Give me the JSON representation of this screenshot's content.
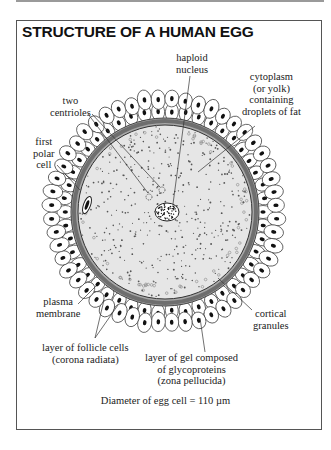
{
  "figure": {
    "title": "STRUCTURE OF A HUMAN EGG",
    "caption": "Diameter of egg cell = 110 µm"
  },
  "labels": {
    "haploid_nucleus": [
      "haploid",
      "nucleus"
    ],
    "cytoplasm": [
      "cytoplasm",
      "(or yolk)",
      "containing",
      "droplets of fat"
    ],
    "two_centrioles": [
      "two",
      "centrioles"
    ],
    "first_polar_cell": [
      "first",
      "polar",
      "cell"
    ],
    "plasma_membrane": [
      "plasma",
      "membrane"
    ],
    "cortical_granules": [
      "cortical",
      "granules"
    ],
    "corona_radiata": [
      "layer of follicle cells",
      "(corona radiata)"
    ],
    "zona_pellucida": [
      "layer of gel composed",
      "of glycoproteins",
      "(zona pellucida)"
    ]
  },
  "colors": {
    "cytoplasm_fill": "#e4e4e4",
    "zona_band": "#7a7a7a",
    "zona_inner": "#a8a8a8",
    "follicle_nucleus": "#111111",
    "frame": "#555555"
  }
}
